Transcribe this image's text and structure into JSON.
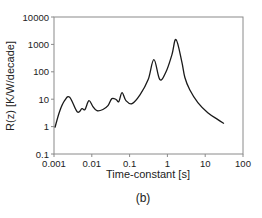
{
  "chart_data": {
    "type": "line",
    "title": "",
    "caption": "(b)",
    "xlabel": "Time-constant  [s]",
    "ylabel": "R(z)  [K/W/decade]",
    "xscale": "log",
    "yscale": "log",
    "xlim": [
      0.001,
      100
    ],
    "ylim": [
      0.1,
      10000
    ],
    "x_ticks": [
      "0.001",
      "0.01",
      "0.1",
      "1",
      "10",
      "100"
    ],
    "y_ticks": [
      "0.1",
      "1",
      "10",
      "100",
      "1000",
      "10000"
    ],
    "grid": false,
    "legend": null,
    "series": [
      {
        "name": "R(z)",
        "color": "#1a1a1a",
        "x": [
          0.00106,
          0.0014,
          0.0019,
          0.0026,
          0.0041,
          0.0055,
          0.0066,
          0.0084,
          0.0107,
          0.0137,
          0.0197,
          0.0268,
          0.034,
          0.044,
          0.052,
          0.063,
          0.08,
          0.116,
          0.19,
          0.31,
          0.44,
          0.63,
          0.92,
          1.32,
          1.69,
          2.4,
          2.9,
          3.9,
          6.4,
          11.7,
          21.7,
          31.4
        ],
        "y": [
          0.92,
          3.5,
          8.8,
          11.8,
          3.5,
          4.5,
          4.2,
          8.9,
          5.4,
          3.8,
          4.2,
          5.8,
          10.5,
          9.7,
          8.2,
          17.4,
          8.9,
          6.9,
          14.7,
          52,
          278,
          52,
          100,
          425,
          1500,
          236,
          62,
          22,
          7.5,
          3.2,
          1.8,
          1.3
        ]
      }
    ]
  },
  "plot_area": {
    "left": 54,
    "top": 17,
    "right": 243,
    "bottom": 154
  },
  "colors": {
    "axis": "#8a8a8a",
    "line": "#1a1a1a",
    "text": "#222222",
    "background": "#ffffff"
  }
}
